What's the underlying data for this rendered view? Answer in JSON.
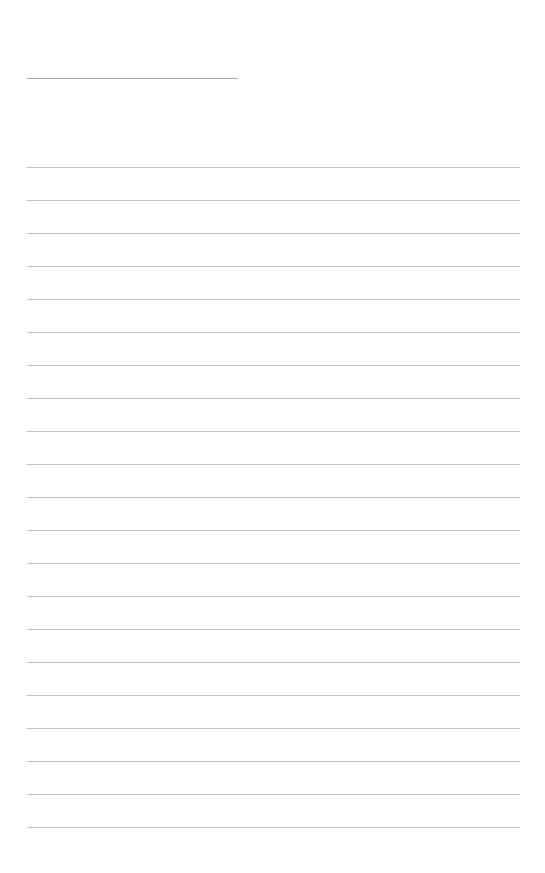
{
  "page": {
    "type": "lined-notepad-sheet",
    "background_color": "#ffffff",
    "line_color": "#a9a9a9",
    "header": {
      "line_color": "#8a8a8a",
      "title_text": "",
      "faint_bleedthrough_text": ""
    },
    "ruled_lines": {
      "count": 21,
      "first_y": 167,
      "spacing": 33,
      "left_x": 27,
      "right_x": 520
    },
    "content_lines": [
      "",
      "",
      "",
      "",
      "",
      "",
      "",
      "",
      "",
      "",
      "",
      "",
      "",
      "",
      "",
      "",
      "",
      "",
      "",
      "",
      ""
    ]
  }
}
